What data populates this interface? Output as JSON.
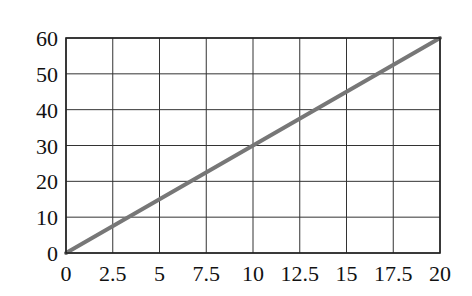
{
  "chart_data": {
    "type": "line",
    "title": "",
    "xlabel": "",
    "ylabel": "",
    "xlim": [
      0,
      20
    ],
    "ylim": [
      0,
      60
    ],
    "grid": true,
    "legend": null,
    "x_ticks": [
      "0",
      "2.5",
      "5",
      "7.5",
      "10",
      "12.5",
      "15",
      "17.5",
      "20"
    ],
    "y_ticks": [
      "0",
      "10",
      "20",
      "30",
      "40",
      "50",
      "60"
    ],
    "series": [
      {
        "name": "y = 3x",
        "x": [
          0,
          20
        ],
        "y": [
          0,
          60
        ],
        "color": "#777777"
      }
    ]
  },
  "colors": {
    "grid": "#333333",
    "frame": "#222222",
    "line": "#777777"
  }
}
